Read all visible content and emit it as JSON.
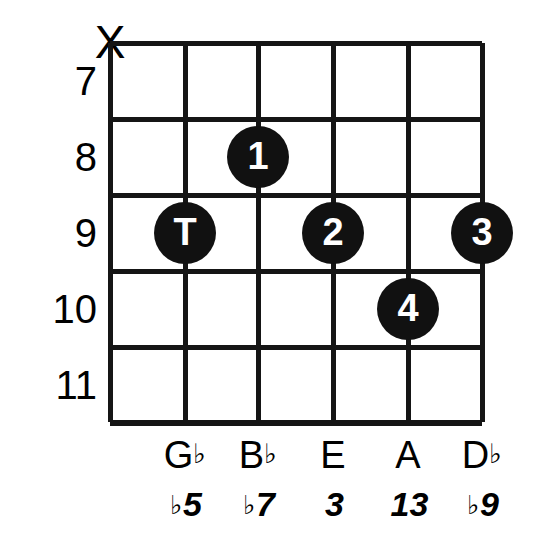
{
  "diagram": {
    "type": "guitar-chord-diagram",
    "strings": 6,
    "frets": 5,
    "fret_numbers": [
      "7",
      "8",
      "9",
      "10",
      "11"
    ],
    "muted_strings": [
      {
        "string_index": 0,
        "marker": "X"
      }
    ],
    "markers": [
      {
        "label": "T",
        "string_index": 1,
        "fret_number": "9",
        "finger": "thumb"
      },
      {
        "label": "1",
        "string_index": 2,
        "fret_number": "8",
        "finger": "index"
      },
      {
        "label": "2",
        "string_index": 3,
        "fret_number": "9",
        "finger": "middle"
      },
      {
        "label": "4",
        "string_index": 4,
        "fret_number": "10",
        "finger": "ring"
      },
      {
        "label": "3",
        "string_index": 5,
        "fret_number": "9",
        "finger": "pinky"
      }
    ],
    "note_names": [
      {
        "letter": "G",
        "accidental": "♭"
      },
      {
        "letter": "B",
        "accidental": "♭"
      },
      {
        "letter": "E",
        "accidental": ""
      },
      {
        "letter": "A",
        "accidental": ""
      },
      {
        "letter": "D",
        "accidental": "♭"
      }
    ],
    "intervals": [
      {
        "accidental": "♭",
        "degree": "5"
      },
      {
        "accidental": "♭",
        "degree": "7"
      },
      {
        "accidental": "",
        "degree": "3"
      },
      {
        "accidental": "",
        "degree": "13"
      },
      {
        "accidental": "♭",
        "degree": "9"
      }
    ],
    "colors": {
      "line": "#151515",
      "dot_fill": "#111111",
      "dot_text": "#ffffff",
      "background": "#ffffff",
      "text": "#000000"
    }
  }
}
